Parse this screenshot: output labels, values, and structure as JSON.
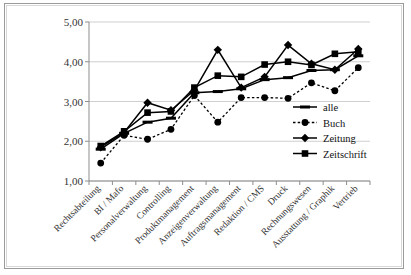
{
  "chart_data": {
    "type": "line",
    "title": "",
    "subtitle": "",
    "xlabel": "",
    "ylabel": "",
    "ylim": [
      1.0,
      5.0
    ],
    "ytick_labels": [
      "1,00",
      "2,00",
      "3,00",
      "4,00",
      "5,00"
    ],
    "ytick_values": [
      1.0,
      2.0,
      3.0,
      4.0,
      5.0
    ],
    "grid": true,
    "legend_position": "inside-right",
    "decimal_separator": ",",
    "categories": [
      "Rechtsabteilung",
      "BI / Mafo",
      "Personalverwaltung",
      "Controlling",
      "Produktmanagement",
      "Anzeigenverwaltung",
      "Auftragsmanagement",
      "Redaktion / CMS",
      "Druck",
      "Rechnungswesen",
      "Ausstattung / Graphik",
      "Vertrieb"
    ],
    "series": [
      {
        "name": "alle",
        "marker": "dash",
        "line_style": "solid",
        "color": "#000000",
        "values": [
          1.8,
          2.2,
          2.48,
          2.58,
          3.22,
          3.25,
          3.32,
          3.55,
          3.6,
          3.78,
          3.8,
          4.15
        ]
      },
      {
        "name": "Buch",
        "marker": "circle",
        "line_style": "dotted",
        "color": "#000000",
        "values": [
          1.45,
          2.15,
          2.05,
          2.3,
          3.15,
          2.48,
          3.1,
          3.1,
          3.08,
          3.47,
          3.27,
          3.85
        ]
      },
      {
        "name": "Zeitung",
        "marker": "diamond",
        "line_style": "solid",
        "color": "#000000",
        "values": [
          1.85,
          2.22,
          2.97,
          2.78,
          3.28,
          4.3,
          3.35,
          3.62,
          4.42,
          3.95,
          3.8,
          4.32
        ]
      },
      {
        "name": "Zeitschrift",
        "marker": "square",
        "line_style": "solid",
        "color": "#000000",
        "values": [
          1.88,
          2.25,
          2.72,
          2.75,
          3.35,
          3.65,
          3.62,
          3.93,
          4.0,
          3.92,
          4.2,
          4.25
        ]
      }
    ]
  }
}
